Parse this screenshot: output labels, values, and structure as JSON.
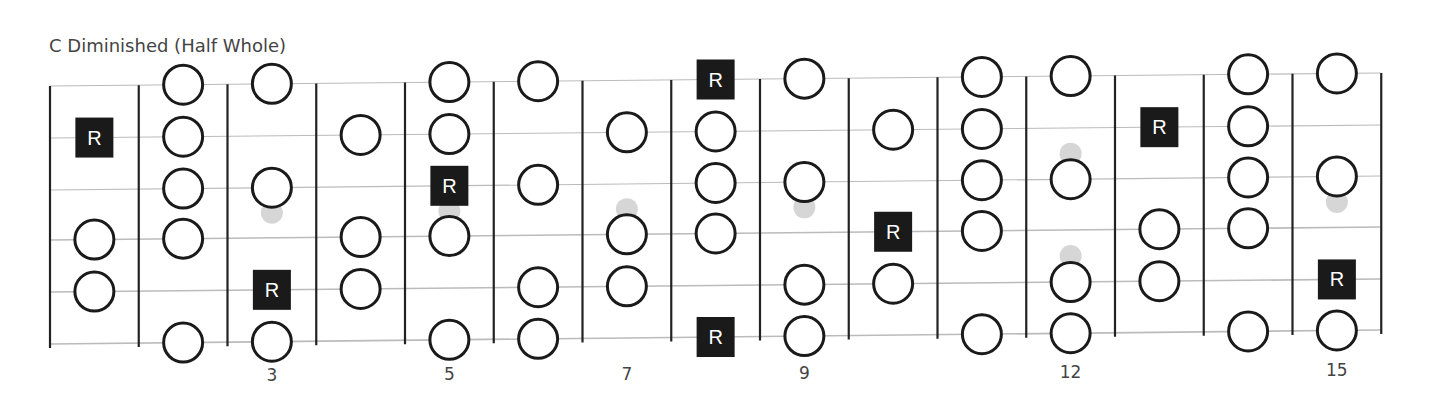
{
  "title": "C Diminished (Half Whole)",
  "colors": {
    "fret_line": "#222222",
    "string_line": "#bbbbbb",
    "note_stroke": "#1a1a1a",
    "root_fill": "#1a1a1a",
    "ghost_fill": "#d6d6d6",
    "text": "#444444"
  },
  "fretboard": {
    "strings": 6,
    "first_fret": 1,
    "last_fret": 15,
    "fret_markers": [
      {
        "fret": 3,
        "label": "3"
      },
      {
        "fret": 5,
        "label": "5"
      },
      {
        "fret": 7,
        "label": "7"
      },
      {
        "fret": 9,
        "label": "9"
      },
      {
        "fret": 12,
        "label": "12"
      },
      {
        "fret": 15,
        "label": "15"
      }
    ],
    "root_label": "R",
    "notes": [
      {
        "fret": 1,
        "string": 1,
        "type": "root"
      },
      {
        "fret": 1,
        "string": 3,
        "type": "note"
      },
      {
        "fret": 1,
        "string": 4,
        "type": "note"
      },
      {
        "fret": 2,
        "string": 0,
        "type": "note"
      },
      {
        "fret": 2,
        "string": 1,
        "type": "note"
      },
      {
        "fret": 2,
        "string": 2,
        "type": "note"
      },
      {
        "fret": 2,
        "string": 3,
        "type": "note"
      },
      {
        "fret": 2,
        "string": 5,
        "type": "note"
      },
      {
        "fret": 3,
        "string": 0,
        "type": "note"
      },
      {
        "fret": 3,
        "string": 2,
        "type": "note"
      },
      {
        "fret": 3,
        "string": 4,
        "type": "root"
      },
      {
        "fret": 3,
        "string": 5,
        "type": "note"
      },
      {
        "fret": 4,
        "string": 1,
        "type": "note"
      },
      {
        "fret": 4,
        "string": 3,
        "type": "note"
      },
      {
        "fret": 4,
        "string": 4,
        "type": "note"
      },
      {
        "fret": 5,
        "string": 0,
        "type": "note"
      },
      {
        "fret": 5,
        "string": 1,
        "type": "note"
      },
      {
        "fret": 5,
        "string": 2,
        "type": "root"
      },
      {
        "fret": 5,
        "string": 3,
        "type": "note"
      },
      {
        "fret": 5,
        "string": 5,
        "type": "note"
      },
      {
        "fret": 6,
        "string": 0,
        "type": "note"
      },
      {
        "fret": 6,
        "string": 2,
        "type": "note"
      },
      {
        "fret": 6,
        "string": 4,
        "type": "note"
      },
      {
        "fret": 6,
        "string": 5,
        "type": "note"
      },
      {
        "fret": 7,
        "string": 1,
        "type": "note"
      },
      {
        "fret": 7,
        "string": 3,
        "type": "note"
      },
      {
        "fret": 7,
        "string": 4,
        "type": "note"
      },
      {
        "fret": 8,
        "string": 0,
        "type": "root"
      },
      {
        "fret": 8,
        "string": 1,
        "type": "note"
      },
      {
        "fret": 8,
        "string": 2,
        "type": "note"
      },
      {
        "fret": 8,
        "string": 3,
        "type": "note"
      },
      {
        "fret": 8,
        "string": 5,
        "type": "root"
      },
      {
        "fret": 9,
        "string": 0,
        "type": "note"
      },
      {
        "fret": 9,
        "string": 2,
        "type": "note"
      },
      {
        "fret": 9,
        "string": 4,
        "type": "note"
      },
      {
        "fret": 9,
        "string": 5,
        "type": "note"
      },
      {
        "fret": 10,
        "string": 1,
        "type": "note"
      },
      {
        "fret": 10,
        "string": 3,
        "type": "root"
      },
      {
        "fret": 10,
        "string": 4,
        "type": "note"
      },
      {
        "fret": 11,
        "string": 0,
        "type": "note"
      },
      {
        "fret": 11,
        "string": 1,
        "type": "note"
      },
      {
        "fret": 11,
        "string": 2,
        "type": "note"
      },
      {
        "fret": 11,
        "string": 3,
        "type": "note"
      },
      {
        "fret": 11,
        "string": 5,
        "type": "note"
      },
      {
        "fret": 12,
        "string": 0,
        "type": "note"
      },
      {
        "fret": 12,
        "string": 2,
        "type": "note"
      },
      {
        "fret": 12,
        "string": 4,
        "type": "note"
      },
      {
        "fret": 12,
        "string": 5,
        "type": "note"
      },
      {
        "fret": 13,
        "string": 1,
        "type": "root"
      },
      {
        "fret": 13,
        "string": 3,
        "type": "note"
      },
      {
        "fret": 13,
        "string": 4,
        "type": "note"
      },
      {
        "fret": 14,
        "string": 0,
        "type": "note"
      },
      {
        "fret": 14,
        "string": 1,
        "type": "note"
      },
      {
        "fret": 14,
        "string": 2,
        "type": "note"
      },
      {
        "fret": 14,
        "string": 3,
        "type": "note"
      },
      {
        "fret": 14,
        "string": 5,
        "type": "note"
      },
      {
        "fret": 15,
        "string": 0,
        "type": "note"
      },
      {
        "fret": 15,
        "string": 2,
        "type": "note"
      },
      {
        "fret": 15,
        "string": 4,
        "type": "root"
      },
      {
        "fret": 15,
        "string": 5,
        "type": "note"
      }
    ],
    "ghost_marks": [
      {
        "fret": 3,
        "y_between": [
          2,
          3
        ]
      },
      {
        "fret": 5,
        "y_between": [
          2,
          3
        ]
      },
      {
        "fret": 7,
        "y_between": [
          2,
          3
        ]
      },
      {
        "fret": 9,
        "y_between": [
          2,
          3
        ]
      },
      {
        "fret": 12,
        "y_between": [
          1,
          2
        ]
      },
      {
        "fret": 12,
        "y_between": [
          3,
          4
        ]
      },
      {
        "fret": 15,
        "y_between": [
          2,
          3
        ]
      }
    ]
  }
}
